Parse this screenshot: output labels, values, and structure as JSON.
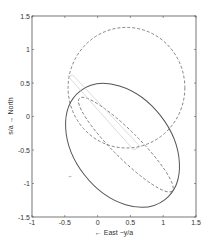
{
  "chart_data": {
    "type": "line",
    "title": "",
    "xlabel": "← East −y/a",
    "ylabel": "s/a → North",
    "xlim": [
      -1,
      1.5
    ],
    "ylim": [
      -1.5,
      1.5
    ],
    "xticks": [
      -1,
      -0.5,
      0,
      0.5,
      1,
      1.5
    ],
    "xtick_labels": [
      "-1",
      "-0.5",
      "0",
      "0.5",
      "1",
      "1.5"
    ],
    "yticks": [
      -1.5,
      -1,
      -0.5,
      0,
      0.5,
      1,
      1.5
    ],
    "ytick_labels": [
      "-1.5",
      "-1",
      "-0.5",
      "0",
      "0.5",
      "1",
      "1.5"
    ],
    "grid": false,
    "legend": null,
    "series": [
      {
        "name": "dashed ellipse (upper)",
        "style": "dashed",
        "shape": "ellipse",
        "center": [
          0.44,
          0.43
        ],
        "radii": [
          0.89,
          0.9
        ],
        "rotation_deg": 0
      },
      {
        "name": "solid ellipse (lower)",
        "style": "solid",
        "shape": "ellipse",
        "center": [
          0.38,
          -0.43
        ],
        "radii": [
          1.05,
          0.72
        ],
        "rotation_deg": -52
      },
      {
        "name": "dashed narrow ellipse",
        "style": "dashed",
        "shape": "ellipse",
        "center": [
          0.43,
          -0.42
        ],
        "radii": [
          1.0,
          0.2
        ],
        "rotation_deg": -45
      },
      {
        "name": "faint solid quadrilateral",
        "style": "solid-light",
        "shape": "polygon",
        "points": [
          [
            -0.45,
            0.6
          ],
          [
            -0.38,
            0.62
          ],
          [
            0.65,
            -0.45
          ],
          [
            0.55,
            -0.5
          ],
          [
            -0.45,
            0.6
          ]
        ]
      }
    ],
    "annotations": [
      {
        "type": "marker",
        "x": -0.42,
        "y": -0.9,
        "glyph": "short dash"
      }
    ]
  }
}
